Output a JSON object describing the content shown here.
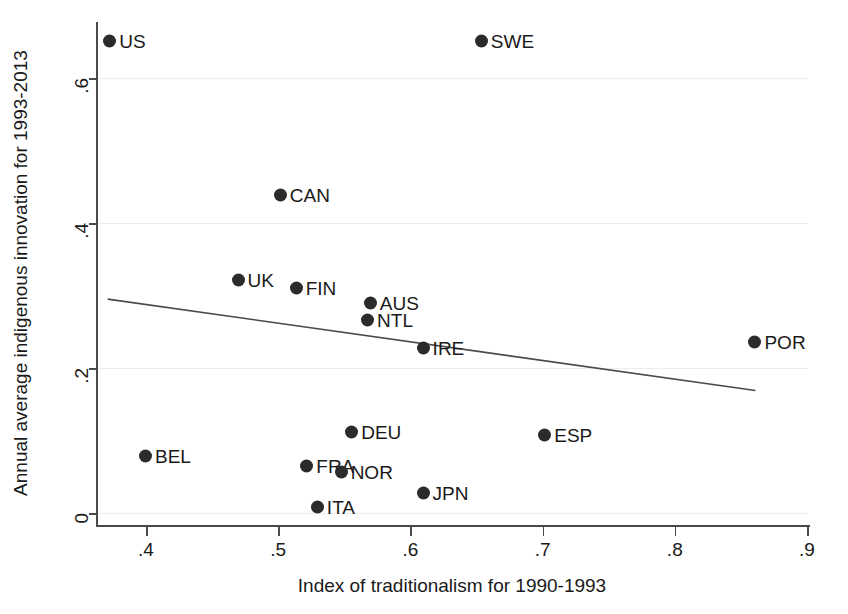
{
  "chart_data": {
    "type": "scatter",
    "title": "",
    "xlabel": "Index of traditionalism for 1990-1993",
    "ylabel": "Annual average indigenous innovation for 1993-2013",
    "xlim": [
      0.365,
      0.905
    ],
    "ylim": [
      -0.012,
      0.695
    ],
    "xticks": [
      0.4,
      0.5,
      0.6,
      0.7,
      0.8,
      0.9
    ],
    "xticklabels": [
      ".4",
      ".5",
      ".6",
      ".7",
      ".8",
      ".9"
    ],
    "yticks": [
      0,
      0.2,
      0.4,
      0.6
    ],
    "yticklabels": [
      "0",
      ".2",
      ".4",
      ".6"
    ],
    "grid": "horizontal",
    "grid_color": "#ededed",
    "marker_color": "#2b2b2b",
    "line_color": "#4a4a4a",
    "legend": "none",
    "points": [
      {
        "label": "US",
        "x": 0.373,
        "y": 0.651
      },
      {
        "label": "SWE",
        "x": 0.654,
        "y": 0.651
      },
      {
        "label": "CAN",
        "x": 0.502,
        "y": 0.438
      },
      {
        "label": "UK",
        "x": 0.47,
        "y": 0.322
      },
      {
        "label": "FIN",
        "x": 0.514,
        "y": 0.31
      },
      {
        "label": "AUS",
        "x": 0.57,
        "y": 0.289
      },
      {
        "label": "NTL",
        "x": 0.568,
        "y": 0.266
      },
      {
        "label": "IRE",
        "x": 0.61,
        "y": 0.228
      },
      {
        "label": "POR",
        "x": 0.861,
        "y": 0.236
      },
      {
        "label": "DEU",
        "x": 0.556,
        "y": 0.112
      },
      {
        "label": "ESP",
        "x": 0.702,
        "y": 0.107
      },
      {
        "label": "BEL",
        "x": 0.4,
        "y": 0.079
      },
      {
        "label": "FRA",
        "x": 0.522,
        "y": 0.065
      },
      {
        "label": "NOR",
        "x": 0.548,
        "y": 0.056
      },
      {
        "label": "JPN",
        "x": 0.61,
        "y": 0.028
      },
      {
        "label": "ITA",
        "x": 0.53,
        "y": 0.008
      }
    ],
    "trendline": {
      "name": "fitted line",
      "x": [
        0.371,
        0.861
      ],
      "y": [
        0.295,
        0.169
      ]
    }
  }
}
